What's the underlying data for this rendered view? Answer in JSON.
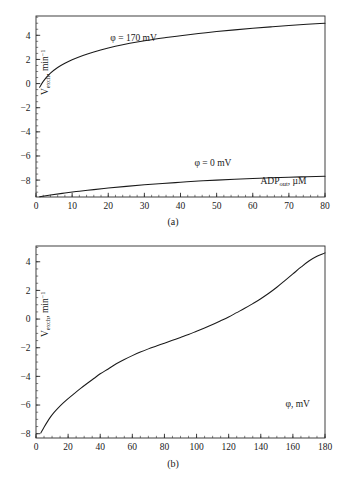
{
  "figure": {
    "panel_a_caption": "(a)",
    "panel_b_caption": "(b)"
  },
  "chart_data": [
    {
      "id": "panel-a",
      "type": "line",
      "title": "",
      "xlabel": "ADP_out, µM",
      "xlabel_parts": {
        "base": "ADP",
        "sub": "out",
        "tail": ", µM"
      },
      "ylabel": "V_exch, min⁻¹",
      "ylabel_parts": {
        "base": "V",
        "sub": "exch",
        "tail": ", min",
        "sup": "−1"
      },
      "xlim": [
        0,
        80
      ],
      "ylim": [
        -9.4,
        5.6
      ],
      "xticks": [
        0,
        10,
        20,
        30,
        40,
        50,
        60,
        70,
        80
      ],
      "xticklabels": [
        "0",
        "10",
        "20",
        "30",
        "40",
        "50",
        "60",
        "70",
        "80"
      ],
      "xminor_step": 2,
      "yticks": [
        4,
        2,
        0,
        -2,
        -4,
        -6,
        -8
      ],
      "yticklabels": [
        "4",
        "2",
        "0",
        "−2",
        "−4",
        "−6",
        "−8"
      ],
      "yminor_step": 0.5,
      "grid": false,
      "legend_position": "inline-annotations",
      "series": [
        {
          "name": "φ = 170 mV",
          "annotation": "φ = 170 mV",
          "annotation_x": 27,
          "annotation_y": 3.55,
          "x": [
            1,
            2,
            4,
            6,
            8,
            10,
            13,
            16,
            20,
            24,
            28,
            32,
            36,
            40,
            45,
            50,
            55,
            60,
            65,
            70,
            75,
            80
          ],
          "y": [
            -0.3,
            0.18,
            0.86,
            1.33,
            1.68,
            1.97,
            2.33,
            2.62,
            2.94,
            3.21,
            3.44,
            3.64,
            3.81,
            3.97,
            4.15,
            4.31,
            4.45,
            4.58,
            4.7,
            4.81,
            4.91,
            5.0
          ]
        },
        {
          "name": "φ = 0 mV",
          "annotation": "φ = 0 mV",
          "annotation_x": 49,
          "annotation_y": -6.85,
          "x": [
            1,
            4,
            8,
            12,
            16,
            20,
            25,
            30,
            35,
            40,
            45,
            50,
            55,
            60,
            65,
            70,
            75,
            80
          ],
          "y": [
            -9.38,
            -9.24,
            -9.07,
            -8.92,
            -8.79,
            -8.66,
            -8.52,
            -8.39,
            -8.28,
            -8.18,
            -8.08,
            -8.0,
            -7.93,
            -7.87,
            -7.81,
            -7.76,
            -7.72,
            -7.68
          ]
        }
      ]
    },
    {
      "id": "panel-b",
      "type": "line",
      "title": "",
      "xlabel": "φ, mV",
      "ylabel": "V_exch, min⁻¹",
      "ylabel_parts": {
        "base": "V",
        "sub": "exch",
        "tail": ", min",
        "sup": "−1"
      },
      "xlim": [
        0,
        180
      ],
      "ylim": [
        -8.3,
        5.1
      ],
      "xticks": [
        0,
        20,
        40,
        60,
        80,
        100,
        120,
        140,
        160,
        180
      ],
      "xticklabels": [
        "0",
        "20",
        "40",
        "60",
        "80",
        "100",
        "120",
        "140",
        "160",
        "180"
      ],
      "xminor_step": 5,
      "yticks": [
        4,
        2,
        0,
        -2,
        -4,
        -6,
        -8
      ],
      "yticklabels": [
        "4",
        "2",
        "0",
        "−2",
        "−4",
        "−6",
        "−8"
      ],
      "yminor_step": 0.5,
      "grid": false,
      "legend_position": "inline-annotations",
      "xlabel_x": 163,
      "xlabel_y": -6.15,
      "series": [
        {
          "name": "V_exch vs φ",
          "x": [
            3,
            5,
            8,
            11,
            14,
            17,
            20,
            24,
            28,
            32,
            36,
            40,
            45,
            50,
            55,
            60,
            65,
            70,
            75,
            80,
            85,
            90,
            95,
            100,
            105,
            110,
            115,
            120,
            125,
            130,
            135,
            140,
            145,
            150,
            155,
            160,
            165,
            170,
            175,
            180
          ],
          "y": [
            -7.95,
            -7.55,
            -7.0,
            -6.55,
            -6.18,
            -5.85,
            -5.55,
            -5.18,
            -4.82,
            -4.48,
            -4.15,
            -3.82,
            -3.48,
            -3.12,
            -2.82,
            -2.55,
            -2.3,
            -2.08,
            -1.88,
            -1.68,
            -1.48,
            -1.28,
            -1.08,
            -0.85,
            -0.62,
            -0.38,
            -0.12,
            0.15,
            0.45,
            0.75,
            1.08,
            1.42,
            1.8,
            2.22,
            2.68,
            3.15,
            3.62,
            4.05,
            4.38,
            4.62
          ]
        }
      ]
    }
  ]
}
